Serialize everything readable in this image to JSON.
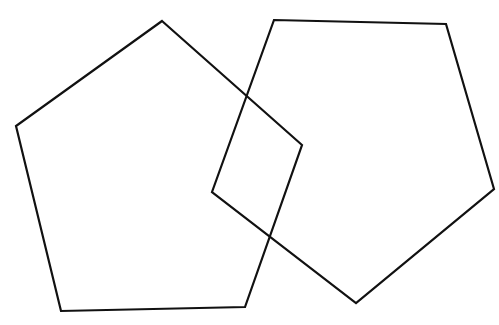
{
  "diagram": {
    "background": "#ffffff",
    "stroke_color": "#111111",
    "stroke_width": 2.2,
    "shapes": [
      {
        "name": "left-pentagon",
        "type": "pentagon",
        "points": "162,21 302,145 245,307 61,311 16,126"
      },
      {
        "name": "right-pentagon",
        "type": "pentagon",
        "points": "274,20 446,24 494,189 356,303 212,192"
      }
    ]
  }
}
